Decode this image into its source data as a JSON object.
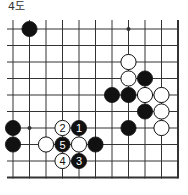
{
  "diagram": {
    "title": "4도",
    "board": {
      "columns": 11,
      "rows": 10,
      "origin_x": 13,
      "origin_y": 29,
      "spacing": 16.5,
      "open_left": true,
      "open_top": true,
      "edge_right": true,
      "edge_bottom": true
    },
    "star_points": [
      {
        "col": 7,
        "row": 0
      },
      {
        "col": 1,
        "row": 6
      }
    ],
    "stones": [
      {
        "color": "black",
        "col": 1,
        "row": 0,
        "label": ""
      },
      {
        "color": "white",
        "col": 7,
        "row": 2,
        "label": ""
      },
      {
        "color": "white",
        "col": 7,
        "row": 3,
        "label": ""
      },
      {
        "color": "black",
        "col": 8,
        "row": 3,
        "label": ""
      },
      {
        "color": "black",
        "col": 6,
        "row": 4,
        "label": ""
      },
      {
        "color": "black",
        "col": 7,
        "row": 4,
        "label": ""
      },
      {
        "color": "white",
        "col": 8,
        "row": 4,
        "label": ""
      },
      {
        "color": "white",
        "col": 9,
        "row": 4,
        "label": ""
      },
      {
        "color": "black",
        "col": 8,
        "row": 5,
        "label": ""
      },
      {
        "color": "white",
        "col": 9,
        "row": 5,
        "label": ""
      },
      {
        "color": "black",
        "col": 7,
        "row": 6,
        "label": ""
      },
      {
        "color": "white",
        "col": 9,
        "row": 6,
        "label": ""
      },
      {
        "color": "black",
        "col": 0,
        "row": 6,
        "label": ""
      },
      {
        "color": "white",
        "col": 3,
        "row": 6,
        "label": "2"
      },
      {
        "color": "black",
        "col": 4,
        "row": 6,
        "label": "1"
      },
      {
        "color": "black",
        "col": 0,
        "row": 7,
        "label": ""
      },
      {
        "color": "white",
        "col": 2,
        "row": 7,
        "label": ""
      },
      {
        "color": "black",
        "col": 3,
        "row": 7,
        "label": "5"
      },
      {
        "color": "white",
        "col": 4,
        "row": 7,
        "label": ""
      },
      {
        "color": "black",
        "col": 5,
        "row": 7,
        "label": ""
      },
      {
        "color": "white",
        "col": 3,
        "row": 8,
        "label": "4"
      },
      {
        "color": "black",
        "col": 4,
        "row": 8,
        "label": "3"
      }
    ],
    "colors": {
      "line": "#333333",
      "black_stone": "#111111",
      "white_stone": "#ffffff",
      "title": "#333333"
    }
  }
}
